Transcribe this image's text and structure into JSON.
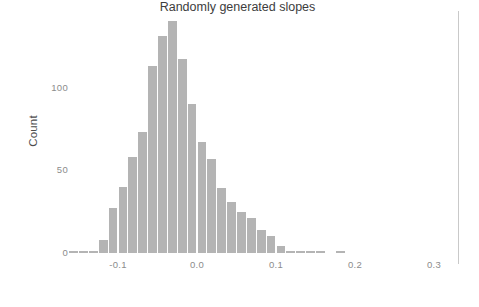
{
  "figure": {
    "background": "#ffffff",
    "bar_color": "#b4b4b4",
    "axis_text_color": "#8c8c8c",
    "title_color": "#3d3d3d",
    "rule_color": "#c9c9c9"
  },
  "axes": {
    "y_title": "Count",
    "x_title": "Randomly generated slopes",
    "y_ticks": [
      {
        "label": "0",
        "value": 0
      },
      {
        "label": "50",
        "value": 50
      },
      {
        "label": "100",
        "value": 100
      }
    ],
    "x_ticks": [
      {
        "label": "-0.1",
        "value": -0.1
      },
      {
        "label": "0.0",
        "value": 0.0
      },
      {
        "label": "0.1",
        "value": 0.1
      },
      {
        "label": "0.2",
        "value": 0.2
      },
      {
        "label": "0.3",
        "value": 0.3
      }
    ]
  },
  "chart_data": {
    "type": "bar",
    "subtype": "histogram",
    "title": "",
    "xlabel": "Randomly generated slopes",
    "ylabel": "Count",
    "xlim": [
      -0.175,
      0.33
    ],
    "ylim": [
      0,
      152
    ],
    "grid": false,
    "legend": null,
    "bin_width": 0.0125,
    "bin_centers": [
      -0.15625,
      -0.14375,
      -0.13125,
      -0.11875,
      -0.10625,
      -0.09375,
      -0.08125,
      -0.06875,
      -0.05625,
      -0.04375,
      -0.03125,
      -0.01875,
      -0.00625,
      0.00625,
      0.01875,
      0.03125,
      0.04375,
      0.05625,
      0.06875,
      0.08125,
      0.09375,
      0.10625,
      0.11875,
      0.13125,
      0.14375,
      0.15625,
      0.18125
    ],
    "bin_edges": [
      -0.1625,
      -0.15,
      -0.1375,
      -0.125,
      -0.1125,
      -0.1,
      -0.0875,
      -0.075,
      -0.0625,
      -0.05,
      -0.0375,
      -0.025,
      -0.0125,
      0.0,
      0.0125,
      0.025,
      0.0375,
      0.05,
      0.0625,
      0.075,
      0.0875,
      0.1,
      0.1125,
      0.125,
      0.1375,
      0.15,
      0.1625,
      0.175,
      0.1875
    ],
    "categories": [
      "-0.156",
      "-0.144",
      "-0.131",
      "-0.119",
      "-0.106",
      "-0.094",
      "-0.081",
      "-0.069",
      "-0.056",
      "-0.044",
      "-0.031",
      "-0.019",
      "-0.006",
      "0.006",
      "0.019",
      "0.031",
      "0.044",
      "0.056",
      "0.069",
      "0.081",
      "0.094",
      "0.106",
      "0.119",
      "0.131",
      "0.144",
      "0.156",
      "0.181"
    ],
    "values": [
      1,
      1,
      1,
      8,
      27,
      40,
      58,
      73,
      113,
      131,
      140,
      117,
      90,
      67,
      57,
      39,
      31,
      25,
      21,
      14,
      10,
      4,
      1,
      1,
      1,
      1,
      1
    ],
    "series": [
      {
        "name": "Randomly generated slopes",
        "values": [
          1,
          1,
          1,
          8,
          27,
          40,
          58,
          73,
          113,
          131,
          140,
          117,
          90,
          67,
          57,
          39,
          31,
          25,
          21,
          14,
          10,
          4,
          1,
          1,
          1,
          1,
          1
        ]
      }
    ],
    "peak_bin_center": -0.03125,
    "peak_value": 140,
    "annotations": []
  }
}
